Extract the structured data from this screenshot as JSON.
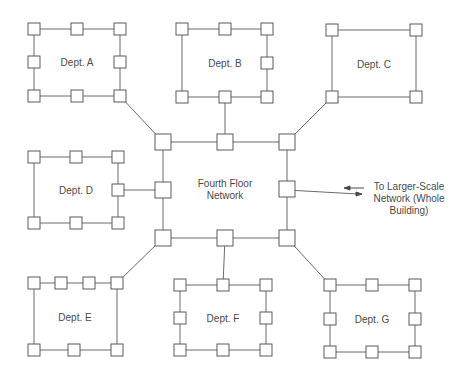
{
  "colors": {
    "line": "#6a6a6a",
    "node_stroke": "#5a5a5a",
    "node_fill": "#ffffff",
    "text": "#4a4a4a"
  },
  "center": {
    "label_line1": "Fourth Floor",
    "label_line2": "Network"
  },
  "external": {
    "label_line1": "To Larger-Scale",
    "label_line2": "Network (Whole",
    "label_line3": "Building)"
  },
  "departments": [
    {
      "id": "A",
      "label": "Dept. A"
    },
    {
      "id": "B",
      "label": "Dept. B"
    },
    {
      "id": "C",
      "label": "Dept. C"
    },
    {
      "id": "D",
      "label": "Dept. D"
    },
    {
      "id": "E",
      "label": "Dept. E"
    },
    {
      "id": "F",
      "label": "Dept. F"
    },
    {
      "id": "G",
      "label": "Dept. G"
    }
  ]
}
